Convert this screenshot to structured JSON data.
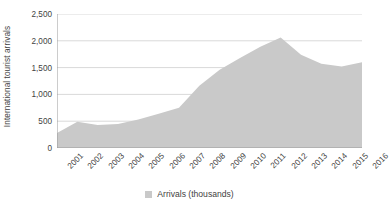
{
  "chart_data": {
    "type": "area",
    "title": "",
    "subtitle": "",
    "xlabel": "",
    "ylabel": "International tourist arrivals",
    "categories": [
      "2001",
      "2002",
      "2003",
      "2004",
      "2005",
      "2006",
      "2007",
      "2008",
      "2009",
      "2010",
      "2011",
      "2012",
      "2013",
      "2014",
      "2015",
      "2016"
    ],
    "series": [
      {
        "name": "Arrivals (thousands)",
        "values": [
          280,
          490,
          430,
          450,
          530,
          640,
          750,
          1160,
          1460,
          1680,
          1890,
          2060,
          1740,
          1570,
          1520,
          1600
        ],
        "color": "#c9c9c9"
      }
    ],
    "ylim": [
      0,
      2500
    ],
    "y_ticks": [
      0,
      500,
      1000,
      1500,
      2000,
      2500
    ],
    "y_tick_labels": [
      "0",
      "500",
      "1,000",
      "1,500",
      "2,000",
      "2,500"
    ],
    "grid": true,
    "grid_axis": "y",
    "grid_color": "#d9d9d9",
    "axis_color": "#9a9a9a",
    "legend": {
      "position": "bottom",
      "entries": [
        {
          "label": "Arrivals (thousands)",
          "color": "#c9c9c9"
        }
      ]
    },
    "x_tick_rotation": -45,
    "background": "#ffffff"
  }
}
